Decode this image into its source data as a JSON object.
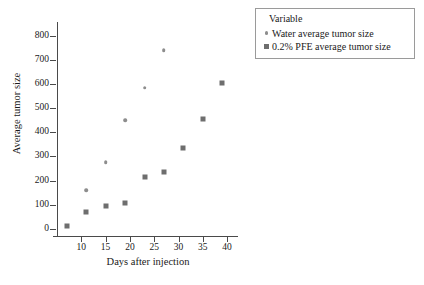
{
  "chart_data": {
    "type": "scatter",
    "title": "",
    "xlabel": "Days after injection",
    "ylabel": "Average tumor size",
    "xlim": [
      5,
      41
    ],
    "ylim": [
      -30,
      840
    ],
    "grid": false,
    "legend_position": "top-right",
    "legend_title": "Variable",
    "x_ticks": [
      10,
      15,
      20,
      25,
      30,
      35,
      40
    ],
    "x_tick_labels": [
      "10",
      "15",
      "20",
      "25",
      "30",
      "35",
      "40"
    ],
    "y_ticks": [
      0,
      100,
      200,
      300,
      400,
      500,
      600,
      700,
      800
    ],
    "y_tick_labels": [
      "0",
      "100",
      "200",
      "300",
      "400",
      "500",
      "600",
      "700",
      "800"
    ],
    "series": [
      {
        "name": "Water average tumor size",
        "marker": "circle",
        "color": "#8d8d8d",
        "points": [
          {
            "x": 11,
            "y": 160
          },
          {
            "x": 15,
            "y": 275
          },
          {
            "x": 19,
            "y": 450
          },
          {
            "x": 23,
            "y": 585
          },
          {
            "x": 27,
            "y": 740
          }
        ]
      },
      {
        "name": "0.2% PFE average tumor size",
        "marker": "square",
        "color": "#6e6e6e",
        "points": [
          {
            "x": 7,
            "y": 10
          },
          {
            "x": 11,
            "y": 70
          },
          {
            "x": 15,
            "y": 95
          },
          {
            "x": 19,
            "y": 105
          },
          {
            "x": 23,
            "y": 215
          },
          {
            "x": 27,
            "y": 235
          },
          {
            "x": 31,
            "y": 335
          },
          {
            "x": 35,
            "y": 455
          },
          {
            "x": 39,
            "y": 605
          }
        ]
      }
    ]
  },
  "legend": {
    "title": "Variable",
    "entries": [
      {
        "label": "Water average tumor size",
        "marker": "circle"
      },
      {
        "label": "0.2% PFE average tumor size",
        "marker": "square"
      }
    ]
  },
  "axes": {
    "x_title": "Days after injection",
    "y_title": "Average tumor size"
  }
}
